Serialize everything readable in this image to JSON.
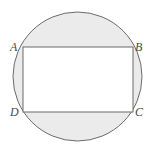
{
  "figure": {
    "type": "geometry-diagram",
    "background_color": "#ffffff",
    "circle": {
      "name": "circumscribed-circle",
      "center_x": 77.5,
      "center_y": 76.5,
      "radius": 64.5,
      "fill_color": "#ebebeb",
      "stroke_color": "#6b6b6b",
      "stroke_width": 1
    },
    "rectangle": {
      "name": "inscribed-rectangle",
      "left": 23,
      "top": 47,
      "right": 133,
      "bottom": 112,
      "width": 110,
      "height": 65,
      "fill_color": "#ffffff",
      "stroke_color": "#6b6b6b",
      "stroke_width": 1
    },
    "labels": [
      {
        "id": "a",
        "text": "A",
        "corner": "top-left"
      },
      {
        "id": "b",
        "text": "B",
        "corner": "top-right"
      },
      {
        "id": "d",
        "text": "D",
        "corner": "bottom-left"
      },
      {
        "id": "c",
        "text": "C",
        "corner": "bottom-right"
      }
    ],
    "label_color": "#4a4a4a"
  }
}
